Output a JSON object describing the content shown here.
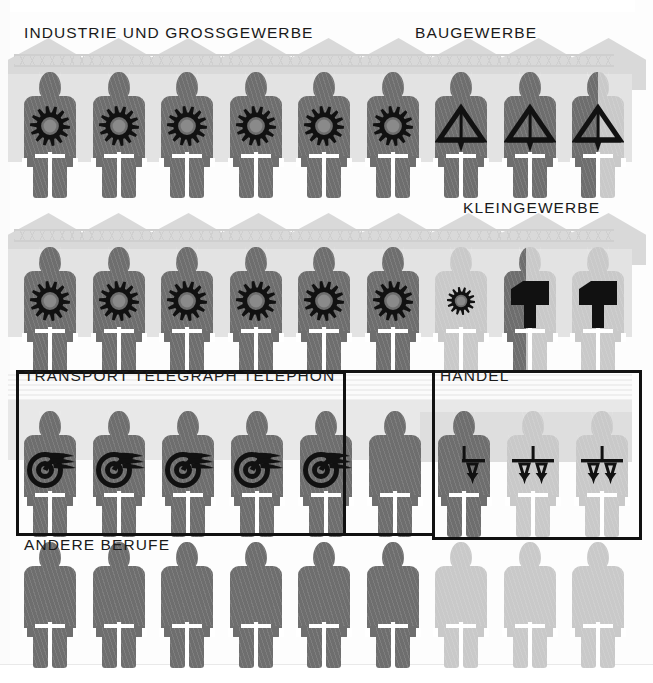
{
  "figure": {
    "colors": {
      "dark_figure": "#6e6e6e",
      "light_figure": "#c9c9c9",
      "emblem": "#111111",
      "frame": "#111111",
      "background": "#fdfdfd",
      "roof_backdrop": "#d9d9d9",
      "wall_band": "#e3e3e3"
    },
    "symbol_legend": [
      {
        "icon": "gear-icon",
        "meaning": "Industrie und Grossgewerbe"
      },
      {
        "icon": "level-triangle-icon",
        "meaning": "Baugewerbe"
      },
      {
        "icon": "hammer-icon",
        "meaning": "Kleingewerbe"
      },
      {
        "icon": "winged-wheel-icon",
        "meaning": "Transport Telegraph Telephon"
      },
      {
        "icon": "balance-scale-icon",
        "meaning": "Handel"
      },
      {
        "icon": "plain-figure-icon",
        "meaning": "Andere Berufe"
      }
    ]
  },
  "chart_data": {
    "type": "pictogram",
    "title": "",
    "xlabel": "",
    "ylabel": "",
    "unit_note": "each full figure = one unit; partial figures are fractional",
    "categories": [
      "Industrie und Grossgewerbe",
      "Baugewerbe",
      "Kleingewerbe",
      "Transport Telegraph Telephon",
      "Handel",
      "Andere Berufe"
    ],
    "values": [
      14.5,
      2.5,
      2.5,
      5.0,
      2.5,
      9.0
    ],
    "series": [
      {
        "name": "Industrie und Grossgewerbe",
        "icon": "gear-icon",
        "full_figures": 14,
        "partial_figures": 1,
        "value": 14.5
      },
      {
        "name": "Baugewerbe",
        "icon": "level-triangle-icon",
        "full_figures": 2,
        "partial_figures": 1,
        "value": 2.5
      },
      {
        "name": "Kleingewerbe",
        "icon": "hammer-icon",
        "full_figures": 2,
        "partial_figures": 1,
        "value": 2.5
      },
      {
        "name": "Transport Telegraph Telephon",
        "icon": "winged-wheel-icon",
        "full_figures": 5,
        "partial_figures": 0,
        "value": 5.0
      },
      {
        "name": "Handel",
        "icon": "balance-scale-icon",
        "full_figures": 2,
        "partial_figures": 1,
        "value": 2.5
      },
      {
        "name": "Andere Berufe",
        "icon": "plain-figure-icon",
        "full_figures": 9,
        "partial_figures": 0,
        "value": 9.0
      }
    ],
    "grid": false,
    "legend_position": "inline-labels"
  },
  "labels": {
    "industrie": "INDUSTRIE UND GROSSGEWERBE",
    "baugewerbe": "BAUGEWERBE",
    "kleingewerbe": "KLEINGEWERBE",
    "transport": "TRANSPORT TELEGRAPH TELEPHON",
    "handel": "HANDEL",
    "andere": "ANDERE BERUFE"
  },
  "rows": [
    {
      "id": "row-1",
      "label": "INDUSTRIE UND GROSSGEWERBE",
      "second_label": "BAUGEWERBE",
      "figures": [
        {
          "emblem": "gear-icon",
          "tone": "dark",
          "fill": 1.0
        },
        {
          "emblem": "gear-icon",
          "tone": "dark",
          "fill": 1.0
        },
        {
          "emblem": "gear-icon",
          "tone": "dark",
          "fill": 1.0
        },
        {
          "emblem": "gear-icon",
          "tone": "dark",
          "fill": 1.0
        },
        {
          "emblem": "gear-icon",
          "tone": "dark",
          "fill": 1.0
        },
        {
          "emblem": "gear-icon",
          "tone": "dark",
          "fill": 1.0
        },
        {
          "emblem": "level-triangle-icon",
          "tone": "dark",
          "fill": 1.0
        },
        {
          "emblem": "level-triangle-icon",
          "tone": "dark",
          "fill": 1.0
        },
        {
          "emblem": "level-triangle-icon",
          "tone": "split",
          "fill": 0.5
        }
      ]
    },
    {
      "id": "row-2",
      "label": "",
      "second_label": "KLEINGEWERBE",
      "figures": [
        {
          "emblem": "gear-icon",
          "tone": "dark",
          "fill": 1.0
        },
        {
          "emblem": "gear-icon",
          "tone": "dark",
          "fill": 1.0
        },
        {
          "emblem": "gear-icon",
          "tone": "dark",
          "fill": 1.0
        },
        {
          "emblem": "gear-icon",
          "tone": "dark",
          "fill": 1.0
        },
        {
          "emblem": "gear-icon",
          "tone": "dark",
          "fill": 1.0
        },
        {
          "emblem": "gear-icon",
          "tone": "dark",
          "fill": 1.0
        },
        {
          "emblem": "gear-small-icon",
          "tone": "light",
          "fill": 0.0
        },
        {
          "emblem": "hammer-icon",
          "tone": "split",
          "fill": 0.42
        },
        {
          "emblem": "hammer-icon",
          "tone": "light",
          "fill": 0.0
        }
      ]
    },
    {
      "id": "row-3",
      "label": "TRANSPORT TELEGRAPH TELEPHON",
      "second_label": "HANDEL",
      "figures": [
        {
          "emblem": "winged-wheel-icon",
          "tone": "dark",
          "fill": 1.0
        },
        {
          "emblem": "winged-wheel-icon",
          "tone": "dark",
          "fill": 1.0
        },
        {
          "emblem": "winged-wheel-icon",
          "tone": "dark",
          "fill": 1.0
        },
        {
          "emblem": "winged-wheel-icon",
          "tone": "dark",
          "fill": 1.0
        },
        {
          "emblem": "winged-wheel-icon",
          "tone": "dark",
          "fill": 1.0
        },
        {
          "emblem": "none",
          "tone": "dark",
          "fill": 1.0
        },
        {
          "emblem": "half-scale-icon",
          "tone": "dark",
          "fill": 1.0
        },
        {
          "emblem": "balance-scale-icon",
          "tone": "light",
          "fill": 0.0
        },
        {
          "emblem": "balance-scale-icon",
          "tone": "light",
          "fill": 0.0
        }
      ]
    },
    {
      "id": "row-4",
      "label": "ANDERE BERUFE",
      "second_label": "",
      "figures": [
        {
          "emblem": "none",
          "tone": "dark",
          "fill": 1.0
        },
        {
          "emblem": "none",
          "tone": "dark",
          "fill": 1.0
        },
        {
          "emblem": "none",
          "tone": "dark",
          "fill": 1.0
        },
        {
          "emblem": "none",
          "tone": "dark",
          "fill": 1.0
        },
        {
          "emblem": "none",
          "tone": "dark",
          "fill": 1.0
        },
        {
          "emblem": "none",
          "tone": "dark",
          "fill": 1.0
        },
        {
          "emblem": "none",
          "tone": "light",
          "fill": 0.0
        },
        {
          "emblem": "none",
          "tone": "light",
          "fill": 0.0
        },
        {
          "emblem": "none",
          "tone": "light",
          "fill": 0.0
        }
      ]
    }
  ]
}
